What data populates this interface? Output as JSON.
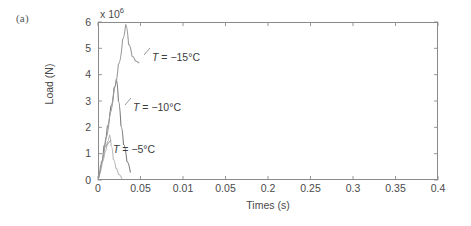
{
  "panel": {
    "label": "(a)"
  },
  "axes": {
    "y_exponent_prefix": "x 10",
    "y_exponent_power": "6",
    "y_title": "Load (N)",
    "x_title": "Times (s)",
    "y_tick_labels": [
      "6",
      "5",
      "4",
      "3",
      "2",
      "1",
      "0"
    ],
    "x_tick_labels": [
      "0",
      "0.05",
      "0.01",
      "0.05",
      "0.2",
      "0.25",
      "0.3",
      "0.35",
      "0.4"
    ]
  },
  "annotations": [
    {
      "name": "annotation-minus15",
      "prefix": "T",
      "text": " = −15°C"
    },
    {
      "name": "annotation-minus10",
      "prefix": "T",
      "text": " = −10°C"
    },
    {
      "name": "annotation-minus5",
      "prefix": "T",
      "text": " = −5°C"
    }
  ],
  "style": {
    "axis_color": "#8a8a8a",
    "curve_color_minus5": "#b9b9b9",
    "curve_color_minus10": "#7d7d7d",
    "curve_color_minus15": "#9a9a9a",
    "text_color": "#4a4a4a"
  },
  "chart_data": {
    "type": "line",
    "title": "",
    "xlabel": "Times (s)",
    "ylabel": "Load (N)",
    "y_scale_multiplier": 1000000,
    "xlim": [
      0,
      0.4
    ],
    "ylim": [
      0,
      6
    ],
    "grid": false,
    "legend_position": "inline-annotations",
    "x_ticks": [
      0,
      0.05,
      0.1,
      0.15,
      0.2,
      0.25,
      0.3,
      0.35,
      0.4
    ],
    "x_tick_labels_as_drawn": [
      "0",
      "0.05",
      "0.01",
      "0.05",
      "0.2",
      "0.25",
      "0.3",
      "0.35",
      "0.4"
    ],
    "y_ticks": [
      0,
      1,
      2,
      3,
      4,
      5,
      6
    ],
    "series": [
      {
        "name": "T = −5°C",
        "peak_x": 0.0135,
        "peak_y": 1.72,
        "x": [
          0.0,
          0.002,
          0.005,
          0.008,
          0.011,
          0.0135,
          0.0155,
          0.018,
          0.021,
          0.024,
          0.028
        ],
        "y": [
          0.05,
          0.28,
          0.68,
          1.05,
          1.45,
          1.72,
          1.3,
          0.78,
          0.45,
          0.22,
          0.06
        ]
      },
      {
        "name": "T = −10°C",
        "peak_x": 0.0215,
        "peak_y": 3.82,
        "x": [
          0.0,
          0.003,
          0.007,
          0.011,
          0.015,
          0.019,
          0.0215,
          0.024,
          0.027,
          0.03,
          0.034,
          0.038
        ],
        "y": [
          0.05,
          0.55,
          1.3,
          2.05,
          2.8,
          3.5,
          3.82,
          3.0,
          2.05,
          1.35,
          0.7,
          0.3
        ]
      },
      {
        "name": "T = −15°C",
        "peak_x": 0.0325,
        "peak_y": 5.9,
        "x": [
          0.0,
          0.004,
          0.009,
          0.014,
          0.019,
          0.024,
          0.029,
          0.0325,
          0.036,
          0.04,
          0.044,
          0.048
        ],
        "y": [
          0.05,
          0.7,
          1.6,
          2.55,
          3.5,
          4.4,
          5.35,
          5.9,
          5.15,
          4.7,
          4.52,
          4.45
        ]
      }
    ]
  }
}
